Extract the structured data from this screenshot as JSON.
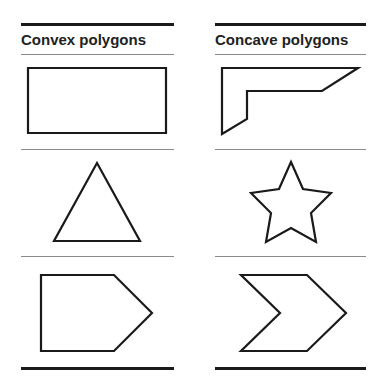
{
  "columns": [
    {
      "title": "Convex polygons",
      "shapes": [
        "rectangle",
        "triangle",
        "pentagon"
      ]
    },
    {
      "title": "Concave polygons",
      "shapes": [
        "l-shape",
        "star",
        "chevron"
      ]
    }
  ],
  "colors": {
    "stroke": "#1a1a1a",
    "rule": "#1a1a1a",
    "divider": "#8a8a8a",
    "background": "#ffffff"
  }
}
